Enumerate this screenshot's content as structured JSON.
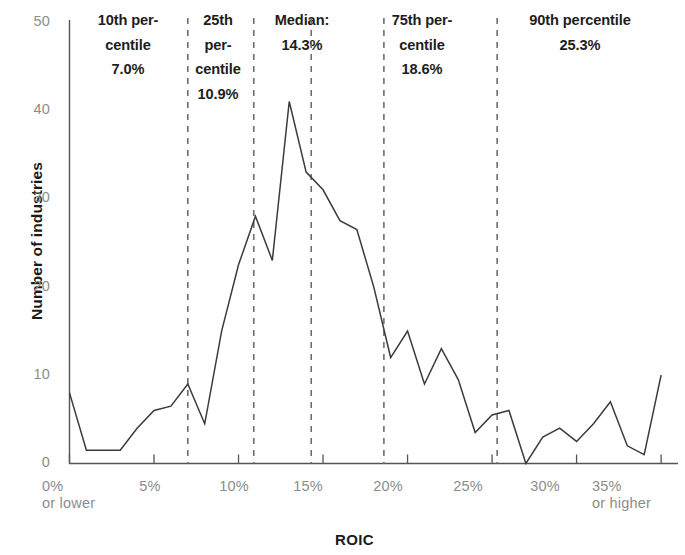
{
  "chart_data": {
    "type": "line",
    "title": "",
    "xlabel": "ROIC",
    "ylabel": "Number of industries",
    "xlim": [
      0,
      36
    ],
    "ylim": [
      0,
      50
    ],
    "grid": false,
    "legend": "none",
    "x_tick_labels": [
      "0%",
      "5%",
      "10%",
      "15%",
      "20%",
      "25%",
      "30%",
      "35%"
    ],
    "x_tick_values": [
      0,
      5,
      10,
      15,
      20,
      25,
      30,
      35
    ],
    "x_first_tick_sub": "or lower",
    "x_last_tick_sub": "or higher",
    "y_tick_labels": [
      "0",
      "10",
      "20",
      "30",
      "40",
      "50"
    ],
    "y_tick_values": [
      0,
      10,
      20,
      30,
      40,
      50
    ],
    "x": [
      0,
      1,
      2,
      3,
      4,
      5,
      6,
      7,
      8,
      9,
      10,
      11,
      12,
      13,
      14,
      15,
      16,
      17,
      18,
      19,
      20,
      21,
      22,
      23,
      24,
      25,
      26,
      27,
      28,
      29,
      30,
      31,
      32,
      33,
      34,
      35
    ],
    "values": [
      8,
      1.5,
      1.5,
      1.5,
      4,
      6,
      6.5,
      9,
      4.5,
      15,
      22.5,
      28,
      23,
      41,
      33,
      31,
      27.5,
      26.5,
      20,
      12,
      15,
      9,
      13,
      9.5,
      3.5,
      5.5,
      6,
      0,
      3,
      4,
      2.5,
      4.5,
      7,
      2,
      1,
      10
    ],
    "series_name": "Number of industries by ROIC",
    "line_color": "#3b3b3b",
    "annotation_lines": [
      {
        "id": "p10",
        "value": 7.0,
        "label": "10th percentile 7.0%"
      },
      {
        "id": "p25",
        "value": 10.9,
        "label": "25th percentile 10.9%"
      },
      {
        "id": "median",
        "value": 14.3,
        "label": "Median: 14.3%"
      },
      {
        "id": "p75",
        "value": 18.6,
        "label": "75th percentile 18.6%"
      },
      {
        "id": "p90",
        "value": 25.3,
        "label": "90th percentile 25.3%"
      }
    ]
  },
  "axes": {
    "y_title": "Number of industries",
    "x_title": "ROIC",
    "y_ticks": [
      {
        "label": "50"
      },
      {
        "label": "40"
      },
      {
        "label": "30"
      },
      {
        "label": "20"
      },
      {
        "label": "10"
      },
      {
        "label": "0"
      }
    ],
    "x_ticks": [
      {
        "label": "0%",
        "sub": "or lower"
      },
      {
        "label": "5%",
        "sub": ""
      },
      {
        "label": "10%",
        "sub": ""
      },
      {
        "label": "15%",
        "sub": ""
      },
      {
        "label": "20%",
        "sub": ""
      },
      {
        "label": "25%",
        "sub": ""
      },
      {
        "label": "30%",
        "sub": ""
      },
      {
        "label": "35%",
        "sub": "or higher"
      }
    ]
  },
  "annotations": {
    "p10": {
      "line1": "10th per-",
      "line2": "centile",
      "line3": "7.0%"
    },
    "p25": {
      "line1": "25th",
      "line2": "per-",
      "line3": "centile",
      "line4": "10.9%"
    },
    "median": {
      "line1": "Median:",
      "line2": "14.3%"
    },
    "p75": {
      "line1": "75th per-",
      "line2": "centile",
      "line3": "18.6%"
    },
    "p90": {
      "line1": "90th percentile",
      "line2": "25.3%"
    }
  },
  "colors": {
    "line": "#3b3b3b",
    "axis": "#555555",
    "tick_text": "#8c8c8c",
    "annotation_text": "#1d1d1d",
    "dash": "#6e6e6e"
  }
}
